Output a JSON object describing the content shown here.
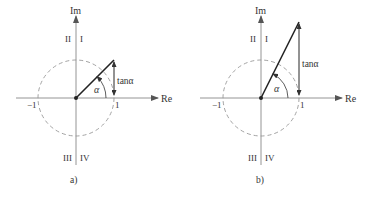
{
  "figure": {
    "panels": [
      {
        "id": "a",
        "caption": "a)",
        "axis_x_label": "Re",
        "axis_y_label": "Im",
        "quadrants": {
          "q1": "I",
          "q2": "II",
          "q3": "III",
          "q4": "IV"
        },
        "tick_neg_one": "−1",
        "tick_one": "1",
        "angle_label": "α",
        "tan_label": "tanα",
        "angle_deg": 45
      },
      {
        "id": "b",
        "caption": "b)",
        "axis_x_label": "Re",
        "axis_y_label": "Im",
        "quadrants": {
          "q1": "I",
          "q2": "II",
          "q3": "III",
          "q4": "IV"
        },
        "tick_neg_one": "−1",
        "tick_one": "1",
        "angle_label": "α",
        "tan_label": "tanα",
        "angle_deg": 63.4
      }
    ],
    "colors": {
      "axis": "#888888",
      "circle": "#999999",
      "vector": "#222222",
      "text": "#333333"
    }
  }
}
